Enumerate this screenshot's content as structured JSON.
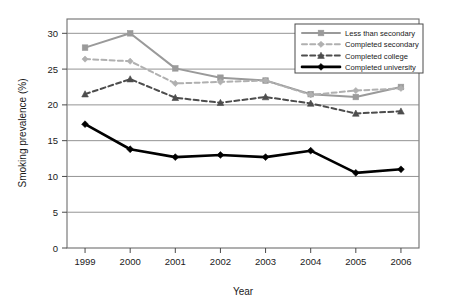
{
  "chart_data": {
    "type": "line",
    "title": "",
    "xlabel": "Year",
    "ylabel": "Smoking prevalence (%)",
    "categories": [
      "1999",
      "2000",
      "2001",
      "2002",
      "2003",
      "2004",
      "2005",
      "2006"
    ],
    "x": [
      1999,
      2000,
      2001,
      2002,
      2003,
      2004,
      2005,
      2006
    ],
    "xlim": [
      1998.6,
      2006.4
    ],
    "ylim": [
      0,
      32
    ],
    "yticks": [
      0,
      5,
      10,
      15,
      20,
      25,
      30
    ],
    "ytick_labels": [
      "0",
      "5",
      "10",
      "15",
      "20",
      "25",
      "30"
    ],
    "grid": "horizontal",
    "legend_position": "top-right",
    "series": [
      {
        "name": "Less than secondary",
        "values": [
          28.0,
          30.0,
          25.1,
          23.8,
          23.4,
          21.5,
          21.1,
          22.5
        ],
        "color": "#9a9a9a",
        "line_style": "solid",
        "marker": "square"
      },
      {
        "name": "Completed secondary",
        "values": [
          26.4,
          26.1,
          23.0,
          23.2,
          23.4,
          21.4,
          22.0,
          22.3
        ],
        "color": "#b0b0b0",
        "line_style": "dashed",
        "marker": "diamond"
      },
      {
        "name": "Completed college",
        "values": [
          21.5,
          23.6,
          21.0,
          20.3,
          21.1,
          20.2,
          18.8,
          19.1
        ],
        "color": "#4d4d4d",
        "line_style": "dashed",
        "marker": "triangle"
      },
      {
        "name": "Completed university",
        "values": [
          17.3,
          13.8,
          12.7,
          13.0,
          12.7,
          13.6,
          10.5,
          11.0
        ],
        "color": "#000000",
        "line_style": "solid",
        "marker": "diamond"
      }
    ]
  },
  "legend": {
    "items": [
      {
        "label": "Less than secondary"
      },
      {
        "label": "Completed secondary"
      },
      {
        "label": "Completed college"
      },
      {
        "label": "Completed university"
      }
    ]
  },
  "colors": {
    "frame": "#6e6e6e",
    "grid": "#888888",
    "text": "#1a1a1a",
    "background": "#ffffff",
    "series_less_than_secondary": "#9a9a9a",
    "series_completed_secondary": "#b0b0b0",
    "series_completed_college": "#4d4d4d",
    "series_completed_university": "#000000"
  }
}
